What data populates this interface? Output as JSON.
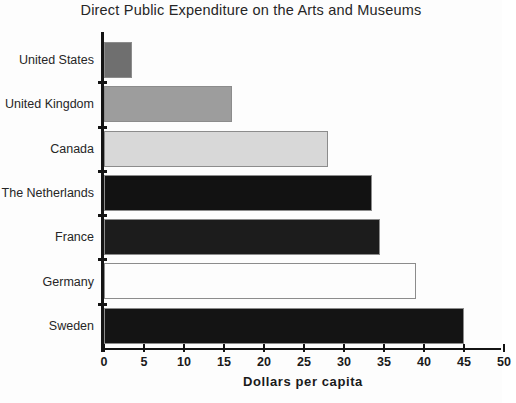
{
  "chart_data": {
    "type": "bar",
    "orientation": "horizontal",
    "title": "Direct Public Expenditure on the Arts and Museums",
    "xlabel": "Dollars per capita",
    "ylabel": "",
    "xlim": [
      0,
      50
    ],
    "xticks": [
      0,
      5,
      10,
      15,
      20,
      25,
      30,
      35,
      40,
      45,
      50
    ],
    "xtick_labels": [
      "0",
      "5",
      "10",
      "15",
      "20",
      "25",
      "30",
      "35",
      "40",
      "45",
      "50"
    ],
    "grid": false,
    "legend": null,
    "categories": [
      "United States",
      "United Kingdom",
      "Canada",
      "The Netherlands",
      "France",
      "Germany",
      "Sweden"
    ],
    "values": [
      3.5,
      16,
      28,
      33.5,
      34.5,
      39,
      45
    ],
    "bar_colors": [
      "#6f6f6f",
      "#9d9d9d",
      "#d8d8d8",
      "#121212",
      "#1c1c1c",
      "#fdfdfd",
      "#141414"
    ],
    "bar_edge_color": "#8c8c8c",
    "axis_color": "#141414",
    "background_color": "#fdfdfd",
    "text_color": "#262626"
  }
}
